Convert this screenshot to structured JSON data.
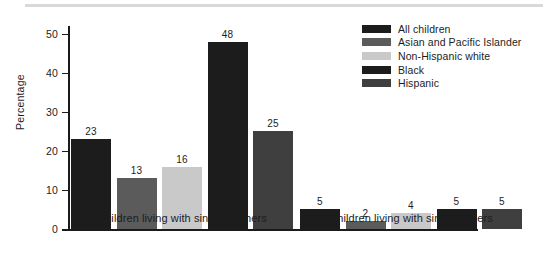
{
  "chart_data": {
    "type": "bar",
    "title": "",
    "xlabel": "",
    "ylabel": "Percentage",
    "ylim": [
      0,
      52
    ],
    "yticks": [
      0,
      10,
      20,
      30,
      40,
      50
    ],
    "ytick_labels": [
      "0",
      "10",
      "20",
      "30",
      "40",
      "50"
    ],
    "grid": false,
    "legend_position": "top-right",
    "categories": [
      "Children living with single mothers",
      "Children living with single fathers"
    ],
    "series": [
      {
        "name": "All children",
        "color": "#1c1c1c",
        "values": [
          23,
          5
        ]
      },
      {
        "name": "Asian and Pacific Islander",
        "color": "#5b5b5b",
        "values": [
          13,
          2
        ]
      },
      {
        "name": "Non-Hispanic white",
        "color": "#c9c9c9",
        "values": [
          16,
          4
        ]
      },
      {
        "name": "Black",
        "color": "#1c1c1c",
        "values": [
          48,
          5
        ]
      },
      {
        "name": "Hispanic",
        "color": "#3f3f3f",
        "values": [
          25,
          5
        ]
      }
    ],
    "value_labels": {
      "group_0": [
        "23",
        "13",
        "16",
        "48",
        "25"
      ],
      "group_1": [
        "5",
        "2",
        "4",
        "5",
        "5"
      ]
    }
  },
  "axis": {
    "y_title": "Percentage",
    "ticks": [
      "50",
      "40",
      "30",
      "20",
      "10",
      "0"
    ]
  },
  "legend": {
    "items": [
      {
        "label": "All children"
      },
      {
        "label": "Asian and Pacific Islander"
      },
      {
        "label": "Non-Hispanic white"
      },
      {
        "label": "Black"
      },
      {
        "label": "Hispanic"
      }
    ]
  },
  "groups": [
    {
      "label": "Children living with single mothers"
    },
    {
      "label": "Children living with single fathers"
    }
  ]
}
